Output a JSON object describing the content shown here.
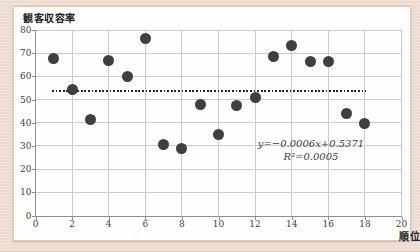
{
  "colors": {
    "page_bg": "#ebdacd",
    "panel_bg": "#fefefe",
    "grid": "#cbcbcb",
    "spine": "#8f8f8f",
    "marker": "#3f3f3f",
    "trend": "#222222",
    "label_text": "#404040"
  },
  "chart_data": {
    "type": "scatter",
    "title": "",
    "ylabel": "観客収容率",
    "xlabel": "順位",
    "xlim": [
      0,
      20
    ],
    "ylim": [
      0,
      80
    ],
    "x_ticks": [
      0,
      2,
      4,
      6,
      8,
      10,
      12,
      14,
      16,
      18,
      20
    ],
    "y_ticks": [
      0,
      10,
      20,
      30,
      40,
      50,
      60,
      70,
      80
    ],
    "grid": true,
    "legend": "none",
    "series": [
      {
        "name": "観客収容率",
        "marker_color": "#3f3f3f",
        "points": [
          {
            "x": 1,
            "y": 67.5
          },
          {
            "x": 2,
            "y": 54.5
          },
          {
            "x": 3,
            "y": 41.5
          },
          {
            "x": 4,
            "y": 67
          },
          {
            "x": 5,
            "y": 60
          },
          {
            "x": 6,
            "y": 76.5
          },
          {
            "x": 7,
            "y": 30.5
          },
          {
            "x": 8,
            "y": 29
          },
          {
            "x": 9,
            "y": 48
          },
          {
            "x": 10,
            "y": 35
          },
          {
            "x": 11,
            "y": 47.5
          },
          {
            "x": 12,
            "y": 51
          },
          {
            "x": 13,
            "y": 68.5
          },
          {
            "x": 14,
            "y": 73.5
          },
          {
            "x": 15,
            "y": 66.5
          },
          {
            "x": 16,
            "y": 66.5
          },
          {
            "x": 17,
            "y": 44
          },
          {
            "x": 18,
            "y": 39.5
          }
        ]
      }
    ],
    "trendline": {
      "style": "dotted",
      "color": "#222222",
      "x_start": 0.9,
      "x_end": 18.05,
      "y_start": 53.75,
      "y_end": 53.64,
      "equation": "y=−0.0006x+0.5371",
      "r_squared_label": "R²=0.0005"
    }
  }
}
